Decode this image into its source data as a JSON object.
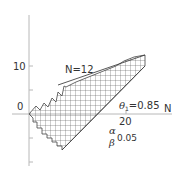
{
  "diagram": {
    "type": "sequential-test-region",
    "axes": {
      "x_label": "N",
      "x_ticks": [
        {
          "value": 20,
          "label": "20"
        }
      ],
      "y_ticks": [
        {
          "value": 10,
          "label": "10"
        },
        {
          "value": 0,
          "label": "0"
        }
      ]
    },
    "annotations": {
      "n_label": "N=12",
      "theta_symbol": "θ",
      "theta_subscript": "1",
      "theta_value": "=0.85",
      "alpha_symbol": "α",
      "beta_symbol": "β",
      "alpha_beta_value": "0.05"
    },
    "colors": {
      "axis": "#b8b8b8",
      "boundary": "#444444",
      "hatch": "#555555",
      "text": "#333333"
    }
  }
}
